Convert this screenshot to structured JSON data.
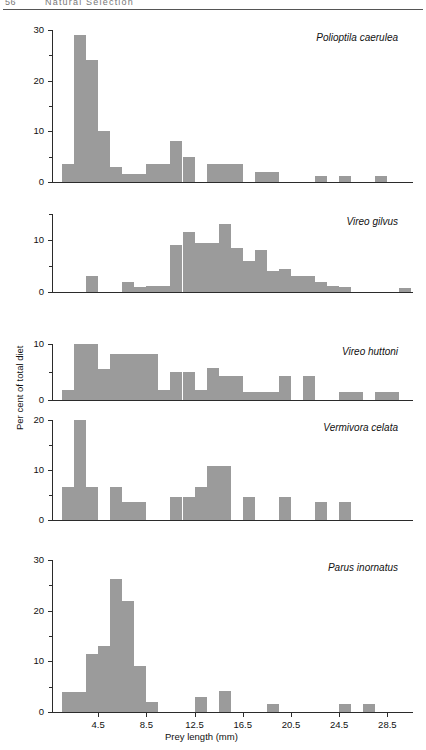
{
  "page": {
    "number": "56",
    "running_title": "Natural Selection"
  },
  "chart_data": {
    "type": "bar",
    "title": "",
    "subtitle": "",
    "xlabel": "Prey length (mm)",
    "ylabel": "Per cent of total diet",
    "grid": false,
    "legend": "none",
    "bin_width_mm": 1,
    "x_first_bin_left_mm": 1.5,
    "xlim": [
      1.5,
      30.5
    ],
    "xticks": [
      4.5,
      8.5,
      12.5,
      16.5,
      20.5,
      24.5,
      28.5
    ],
    "xtick_labels": [
      "4.5",
      "8.5",
      "12.5",
      "16.5",
      "20.5",
      "24.5",
      "28.5"
    ],
    "panels": [
      {
        "species": "Polioptila caerulea",
        "ylim": [
          0,
          30
        ],
        "yticks_major": [
          0,
          10,
          20,
          30
        ],
        "yticks_minor": [
          5,
          15,
          25
        ],
        "ytick_labels": [
          "0",
          "10",
          "20",
          "30"
        ],
        "bin_starts": [
          1.5,
          2.5,
          3.5,
          4.5,
          5.5,
          6.5,
          7.5,
          8.5,
          9.5,
          10.5,
          11.5,
          12.5,
          13.5,
          14.5,
          15.5,
          16.5,
          17.5,
          18.5,
          19.5,
          20.5,
          21.5,
          22.5,
          23.5,
          24.5,
          25.5,
          26.5,
          27.5,
          28.5
        ],
        "values": [
          3.5,
          29,
          24,
          10,
          3,
          1.5,
          1.5,
          3.5,
          3.5,
          8,
          5,
          0,
          3.5,
          3.5,
          3.5,
          0,
          2,
          2,
          0,
          0,
          0,
          1.2,
          0,
          1.2,
          0,
          0,
          1.2,
          0
        ]
      },
      {
        "species": "Vireo gilvus",
        "ylim": [
          0,
          15
        ],
        "yticks_major": [
          0,
          10
        ],
        "yticks_minor": [
          5,
          15
        ],
        "ytick_labels": [
          "0",
          "10"
        ],
        "bin_starts": [
          1.5,
          2.5,
          3.5,
          4.5,
          5.5,
          6.5,
          7.5,
          8.5,
          9.5,
          10.5,
          11.5,
          12.5,
          13.5,
          14.5,
          15.5,
          16.5,
          17.5,
          18.5,
          19.5,
          20.5,
          21.5,
          22.5,
          23.5,
          24.5,
          25.5,
          26.5,
          27.5,
          28.5,
          29.5
        ],
        "values": [
          0,
          0,
          3,
          0,
          0,
          2,
          1,
          1.2,
          1.2,
          9,
          11.5,
          9.5,
          9.5,
          13,
          8.5,
          6,
          8,
          4,
          4.5,
          3,
          3,
          2,
          1.2,
          1,
          0,
          0,
          0,
          0,
          0.8
        ]
      },
      {
        "species": "Vireo huttoni",
        "ylim": [
          0,
          10
        ],
        "yticks_major": [
          0,
          10
        ],
        "yticks_minor": [
          5
        ],
        "ytick_labels": [
          "0",
          "10"
        ],
        "bin_starts": [
          1.5,
          2.5,
          3.5,
          4.5,
          5.5,
          6.5,
          7.5,
          8.5,
          9.5,
          10.5,
          11.5,
          12.5,
          13.5,
          14.5,
          15.5,
          16.5,
          17.5,
          18.5,
          19.5,
          20.5,
          21.5,
          22.5,
          23.5,
          24.5,
          25.5,
          26.5,
          27.5,
          28.5
        ],
        "values": [
          1.8,
          10,
          10,
          5.5,
          8.3,
          8.3,
          8.3,
          8.3,
          1.8,
          5,
          5,
          1.8,
          5.8,
          4.3,
          4.3,
          1.5,
          1.5,
          1.5,
          4.3,
          0,
          4.3,
          0,
          0,
          1.5,
          1.5,
          0,
          1.5,
          1.5
        ]
      },
      {
        "species": "Vermivora celata",
        "ylim": [
          0,
          20
        ],
        "yticks_major": [
          0,
          10,
          20
        ],
        "yticks_minor": [
          5,
          15
        ],
        "ytick_labels": [
          "0",
          "10",
          "20"
        ],
        "bin_starts": [
          1.5,
          2.5,
          3.5,
          4.5,
          5.5,
          6.5,
          7.5,
          8.5,
          9.5,
          10.5,
          11.5,
          12.5,
          13.5,
          14.5,
          15.5,
          16.5,
          17.5,
          18.5,
          19.5,
          20.5,
          21.5,
          22.5,
          23.5,
          24.5,
          25.5,
          26.5,
          27.5,
          28.5
        ],
        "values": [
          6.7,
          20,
          6.7,
          0,
          6.7,
          3.7,
          3.7,
          0,
          0,
          4.7,
          4.7,
          6.7,
          10.8,
          10.8,
          0,
          4.7,
          0,
          0,
          4.7,
          0,
          0,
          3.7,
          0,
          3.7,
          0,
          0,
          0,
          0
        ]
      },
      {
        "species": "Parus inornatus",
        "ylim": [
          0,
          30
        ],
        "yticks_major": [
          0,
          10,
          20,
          30
        ],
        "yticks_minor": [
          5,
          15,
          25
        ],
        "ytick_labels": [
          "0",
          "10",
          "20",
          "30"
        ],
        "bin_starts": [
          1.5,
          2.5,
          3.5,
          4.5,
          5.5,
          6.5,
          7.5,
          8.5,
          9.5,
          10.5,
          11.5,
          12.5,
          13.5,
          14.5,
          15.5,
          16.5,
          17.5,
          18.5,
          19.5,
          20.5,
          21.5,
          22.5,
          23.5,
          24.5,
          25.5,
          26.5,
          27.5,
          28.5
        ],
        "values": [
          4,
          4,
          11.5,
          13,
          26.3,
          22,
          9,
          2,
          0,
          0,
          0,
          3,
          0,
          4.2,
          0,
          0,
          0,
          1.5,
          0,
          0,
          0,
          0,
          0,
          1.5,
          0,
          1.5,
          0,
          0
        ]
      }
    ]
  },
  "colors": {
    "bar": "#9b9b9b",
    "axis": "#2b2b2b",
    "text": "#111111"
  }
}
